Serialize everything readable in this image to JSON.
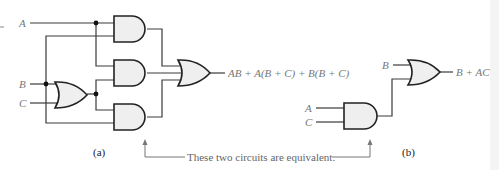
{
  "circuit_a": {
    "inputs": {
      "a": "A",
      "b": "B",
      "c": "C"
    },
    "output_expression": "AB + A(B + C) + B(B + C)",
    "caption": "(a)",
    "gates": [
      "AND",
      "AND",
      "AND",
      "OR",
      "OR"
    ]
  },
  "circuit_b": {
    "inputs": {
      "b": "B",
      "a": "A",
      "c": "C"
    },
    "output_expression": "B + AC",
    "caption": "(b)",
    "gates": [
      "AND",
      "OR"
    ]
  },
  "annotation": {
    "text": "These two circuits are equivalent."
  },
  "colors": {
    "gate_fill": "#efefef",
    "gate_stroke": "#222222",
    "label": "#777777"
  }
}
